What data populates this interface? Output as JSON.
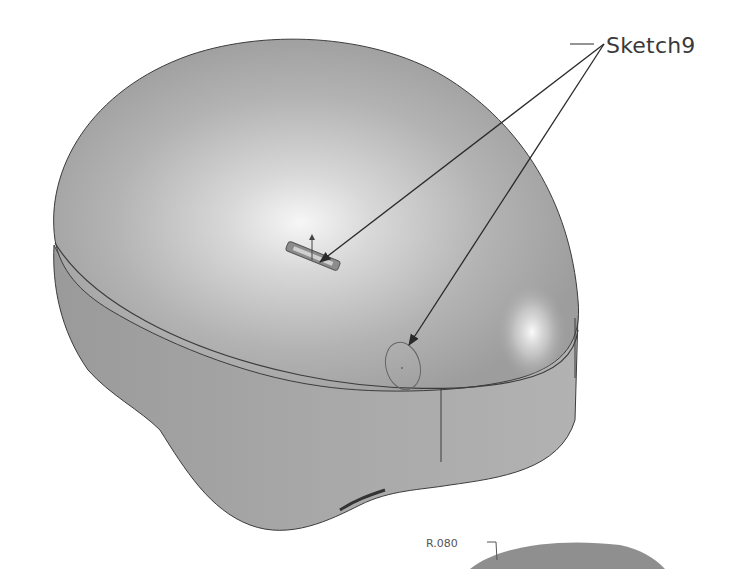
{
  "figure": {
    "type": "CAD model illustration",
    "callouts": [
      {
        "label": "Sketch9",
        "targets": [
          "sketch-slot-on-top-surface",
          "sketch-circle-on-top-surface"
        ]
      }
    ],
    "dimensions": [
      {
        "label": "R.080"
      }
    ],
    "colors": {
      "background": "#ffffff",
      "body_fill": "#a9a9a9",
      "highlight": "#f2f2f2",
      "edge": "#3c3c3c",
      "leader": "#2a2a2a",
      "text": "#3a3a3a"
    }
  }
}
